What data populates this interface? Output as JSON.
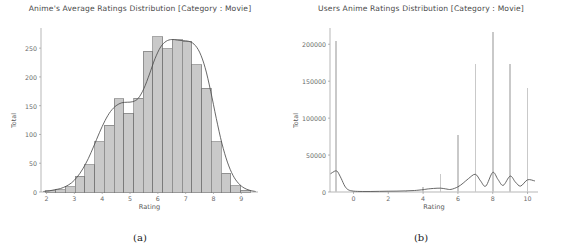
{
  "figure": {
    "panels": [
      {
        "caption": "(a)",
        "title": "Anime's Average Ratings Distribution [Category : Movie]",
        "xlabel": "Rating",
        "ylabel": "Total"
      },
      {
        "caption": "(b)",
        "title": "Users Anime Ratings Distribution [Category : Movie]",
        "xlabel": "Rating",
        "ylabel": "Total"
      }
    ]
  },
  "colors": {
    "bar_fill": "#c9c9c9",
    "bar_edge": "#6d6d6d",
    "kde_line": "#4d4d4d",
    "axis": "#9a9a9a",
    "tick_text": "#6a6a6a",
    "title_text": "#4a4a4a",
    "background": "#ffffff"
  },
  "chart_data": [
    {
      "type": "bar",
      "title": "Anime's Average Ratings Distribution [Category : Movie]",
      "xlabel": "Rating",
      "ylabel": "Total",
      "xlim": [
        1.8,
        9.6
      ],
      "ylim": [
        0,
        285
      ],
      "xticks": [
        2,
        3,
        4,
        5,
        6,
        7,
        8,
        9
      ],
      "yticks": [
        0,
        50,
        100,
        150,
        200,
        250
      ],
      "grid": false,
      "legend": null,
      "bin_width": 0.35,
      "categories": [
        2.15,
        2.5,
        2.85,
        3.2,
        3.55,
        3.9,
        4.25,
        4.6,
        4.95,
        5.3,
        5.65,
        6.0,
        6.35,
        6.7,
        7.05,
        7.4,
        7.75,
        8.1,
        8.45,
        8.8,
        9.15
      ],
      "values": [
        2,
        4,
        9,
        27,
        47,
        87,
        116,
        162,
        137,
        163,
        245,
        270,
        249,
        265,
        262,
        221,
        180,
        87,
        33,
        11,
        3
      ],
      "kde": {
        "name": "Kernel density estimate",
        "x": [
          1.9,
          2.1,
          2.3,
          2.5,
          2.7,
          2.9,
          3.1,
          3.3,
          3.5,
          3.7,
          3.9,
          4.1,
          4.3,
          4.5,
          4.7,
          4.9,
          5.1,
          5.3,
          5.5,
          5.7,
          5.9,
          6.1,
          6.3,
          6.5,
          6.7,
          6.9,
          7.1,
          7.3,
          7.5,
          7.7,
          7.9,
          8.1,
          8.3,
          8.5,
          8.7,
          8.9,
          9.1,
          9.3,
          9.5
        ],
        "y": [
          1,
          2,
          4,
          6,
          10,
          16,
          26,
          40,
          58,
          80,
          103,
          124,
          140,
          150,
          155,
          156,
          157,
          163,
          180,
          205,
          232,
          252,
          262,
          265,
          264,
          263,
          262,
          257,
          243,
          216,
          175,
          128,
          85,
          52,
          29,
          15,
          7,
          3,
          1
        ]
      }
    },
    {
      "type": "bar",
      "title": "Users Anime Ratings Distribution [Category : Movie]",
      "xlabel": "Rating",
      "ylabel": "Total",
      "xlim": [
        -1.35,
        10.6
      ],
      "ylim": [
        0,
        222000
      ],
      "xticks": [
        0,
        2,
        4,
        6,
        8,
        10
      ],
      "yticks": [
        0,
        50000,
        100000,
        150000,
        200000
      ],
      "grid": false,
      "legend": null,
      "bin_width": 0.09,
      "categories": [
        -1,
        0,
        1,
        2,
        3,
        4,
        5,
        6,
        7,
        8,
        9,
        10
      ],
      "values": [
        205000,
        900,
        500,
        1100,
        1600,
        6200,
        24500,
        76500,
        173000,
        216000,
        173000,
        141000
      ],
      "kde": {
        "name": "Kernel density estimate",
        "x": [
          -1.3,
          -1.1,
          -1.0,
          -0.9,
          -0.7,
          -0.5,
          -0.3,
          0.0,
          0.5,
          1.0,
          1.5,
          2.0,
          2.5,
          3.0,
          3.5,
          4.0,
          4.3,
          4.6,
          5.0,
          5.3,
          5.6,
          6.0,
          6.3,
          6.6,
          7.0,
          7.3,
          7.6,
          8.0,
          8.3,
          8.6,
          9.0,
          9.3,
          9.6,
          10.0,
          10.4
        ],
        "y": [
          25000,
          28000,
          28500,
          27000,
          18000,
          8000,
          3000,
          1200,
          700,
          700,
          900,
          1100,
          1200,
          1500,
          2000,
          3200,
          4200,
          4800,
          5200,
          4200,
          3500,
          7000,
          12000,
          18000,
          24000,
          15000,
          8000,
          26500,
          17000,
          9000,
          21500,
          13500,
          8000,
          16500,
          15000
        ]
      }
    }
  ]
}
